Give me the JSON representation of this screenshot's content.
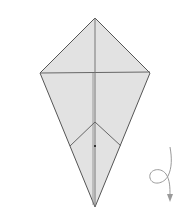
{
  "diagram": {
    "type": "origami-fold-diagram",
    "shape": "kite",
    "colors": {
      "paper_fill": "#e2e2e2",
      "outline": "#555555",
      "crease": "#777777",
      "arrow": "#9a9a9a"
    },
    "symbols": [
      {
        "name": "turn-over-arrow",
        "meaning": "turn over"
      }
    ]
  }
}
